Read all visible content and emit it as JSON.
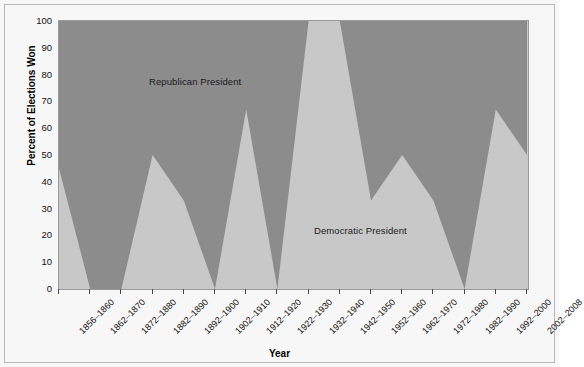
{
  "chart_data": {
    "type": "area",
    "title": "",
    "xlabel": "Year",
    "ylabel": "Percent of Elections Won",
    "ylim": [
      0,
      100
    ],
    "grid": false,
    "legend_position": "in-plot-annotations",
    "categories": [
      "1856-1860",
      "1862-1870",
      "1872-1880",
      "1882-1890",
      "1892-1900",
      "1902-1910",
      "1912-1920",
      "1922-1930",
      "1932-1940",
      "1942-1950",
      "1952-1960",
      "1962-1970",
      "1972-1980",
      "1982-1990",
      "1992-2000",
      "2002-2008"
    ],
    "ytick_labels": [
      "0",
      "10",
      "20",
      "30",
      "40",
      "50",
      "60",
      "70",
      "80",
      "90",
      "100"
    ],
    "ytick_values": [
      0,
      10,
      20,
      30,
      40,
      50,
      60,
      70,
      80,
      90,
      100
    ],
    "series": [
      {
        "name": "Democratic President",
        "color": "#c8c8c8",
        "values": [
          45,
          0,
          0,
          50,
          33,
          0,
          67,
          0,
          100,
          100,
          33,
          50,
          33,
          0,
          67,
          50
        ]
      },
      {
        "name": "Republican President",
        "color": "#8c8c8c",
        "values": [
          55,
          100,
          100,
          50,
          67,
          100,
          33,
          100,
          0,
          0,
          67,
          50,
          67,
          100,
          33,
          50
        ]
      }
    ],
    "annotations": [
      {
        "text": "Republican President",
        "x_category": "1882-1890",
        "y": 80
      },
      {
        "text": "Democratic President",
        "x_category": "1962-1970",
        "y": 25
      }
    ]
  },
  "colors": {
    "republican_fill": "#8c8c8c",
    "democratic_fill": "#c8c8c8",
    "figure_background": "#f7f7f7",
    "frame_border": "#b8b8b8",
    "axis": "#4a4a4a",
    "text": "#111111"
  }
}
